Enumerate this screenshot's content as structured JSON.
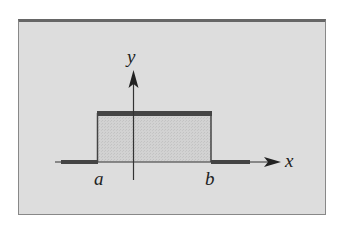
{
  "figure": {
    "title": "",
    "axis_labels": {
      "x": "x",
      "y": "y"
    },
    "tick_labels": {
      "left": "a",
      "right": "b"
    },
    "colors": {
      "panel_background": "#dddddd",
      "panel_border": "#666666",
      "fill": "#cecece",
      "line": "#333333",
      "thick_segment": "#444444"
    }
  }
}
